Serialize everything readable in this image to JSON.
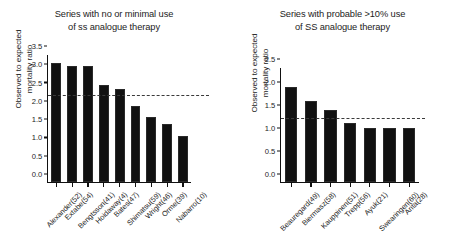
{
  "figure": {
    "background": "#ffffff",
    "bar_color": "#111111",
    "refline_color": "#3a3a3a"
  },
  "chart_data": [
    {
      "type": "bar",
      "panel": "left",
      "title": "Series with no or minimal use\nof ss analogue therapy",
      "xlabel": "",
      "ylabel": "Observed to expected\nmortality ratio",
      "ylim": [
        0.0,
        3.5
      ],
      "yticks": [
        "0.0",
        "0.5",
        "1.0",
        "1.5",
        "2.0",
        "2.5",
        "3.0",
        "3.5"
      ],
      "ytick_values": [
        0.0,
        0.5,
        1.0,
        1.5,
        2.0,
        2.5,
        3.0,
        3.5
      ],
      "grid": false,
      "legend": "none",
      "categories": [
        "Alexander(52)",
        "Extabe(54)",
        "Bengtsson(41)",
        "Hoidaway(4)",
        "Bates(47)",
        "Shimatsu(59)",
        "Wright(46)",
        "Orme(39)",
        "Nabarro(10)"
      ],
      "values": [
        3.29,
        3.19,
        3.19,
        2.68,
        2.57,
        2.08,
        1.78,
        1.58,
        1.27
      ],
      "annotations": [
        {
          "kind": "reference-line",
          "style": "dashed",
          "value": 2.37,
          "label": ""
        }
      ]
    },
    {
      "type": "bar",
      "panel": "right",
      "title": "Series with probable >10% use\nof SS analogue therapy",
      "xlabel": "",
      "ylabel": "Observed to expected\nmortality ratio",
      "ylim": [
        0.0,
        2.5
      ],
      "yticks": [
        "0.0",
        "0.5",
        "1.0",
        "1.5",
        "2.0",
        "2.5"
      ],
      "ytick_values": [
        0.0,
        0.5,
        1.0,
        1.5,
        2.0,
        2.5
      ],
      "grid": false,
      "legend": "none",
      "categories": [
        "Beauregard(49)",
        "Biermasz(58)",
        "Kauppinen(51)",
        "Trepp(56)",
        "Ayuk(21)",
        "Swearingen(60)",
        "Arita(28)"
      ],
      "values": [
        2.08,
        1.78,
        1.58,
        1.3,
        1.19,
        1.19,
        1.18
      ],
      "annotations": [
        {
          "kind": "reference-line",
          "style": "dashed",
          "value": 1.4,
          "label": ""
        }
      ]
    }
  ]
}
